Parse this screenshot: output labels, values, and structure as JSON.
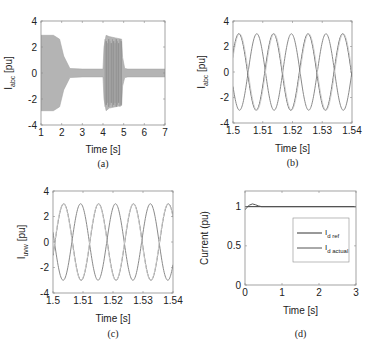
{
  "chart_data": [
    {
      "id": "a",
      "type": "line",
      "caption": "(a)",
      "title": "",
      "xlabel": "Time [s]",
      "ylabel": "I_abc [pu]",
      "ylabel_main": "I",
      "ylabel_sub": "abc",
      "ylabel_unit": "[pu]",
      "xlim": [
        1,
        7
      ],
      "ylim": [
        -4,
        4
      ],
      "xticks": [
        1,
        2,
        3,
        4,
        5,
        6,
        7
      ],
      "yticks": [
        -4,
        -2,
        0,
        2,
        4
      ],
      "grid": false,
      "description": "Three-phase current envelope (dense oscillation band)",
      "envelope": {
        "x": [
          1.0,
          1.6,
          1.9,
          2.1,
          2.4,
          3.0,
          4.0,
          4.05,
          4.15,
          4.3,
          4.6,
          4.9,
          4.95,
          5.05,
          5.2,
          7.0
        ],
        "upper": [
          2.9,
          2.9,
          2.6,
          1.3,
          0.35,
          0.3,
          0.3,
          2.0,
          2.9,
          2.8,
          2.7,
          2.6,
          1.2,
          0.35,
          0.3,
          0.3
        ],
        "lower": [
          -2.9,
          -2.9,
          -2.6,
          -1.3,
          -0.35,
          -0.3,
          -0.3,
          -2.0,
          -2.9,
          -2.7,
          -2.6,
          -2.5,
          -1.0,
          -0.35,
          -0.3,
          -0.3
        ]
      }
    },
    {
      "id": "b",
      "type": "line",
      "caption": "(b)",
      "title": "",
      "xlabel": "Time [s]",
      "ylabel": "I_abc [pu]",
      "ylabel_main": "I",
      "ylabel_sub": "abc",
      "ylabel_unit": "[pu]",
      "xlim": [
        1.5,
        1.54
      ],
      "ylim": [
        -4,
        4
      ],
      "xticks": [
        1.5,
        1.51,
        1.52,
        1.53,
        1.54
      ],
      "xtick_labels": [
        "1.5",
        "1.51",
        "1.52",
        "1.53",
        "1.54"
      ],
      "yticks": [
        -4,
        -2,
        0,
        2,
        4
      ],
      "grid": false,
      "series": [
        {
          "name": "phase a",
          "amplitude": 3.0,
          "frequency_hz": 86,
          "peak_time": 1.508,
          "color": "#8a8a8a"
        },
        {
          "name": "phase b",
          "amplitude": 3.0,
          "frequency_hz": 86,
          "peak_time": 1.5136,
          "color": "#6a6a6a"
        },
        {
          "name": "phase c",
          "amplitude": 3.0,
          "frequency_hz": 86,
          "peak_time": 1.5022,
          "color": "#cfcfcf"
        }
      ]
    },
    {
      "id": "c",
      "type": "line",
      "caption": "(c)",
      "title": "",
      "xlabel": "Time [s]",
      "ylabel": "I_uvw [pu]",
      "ylabel_main": "I",
      "ylabel_sub": "uvw",
      "ylabel_unit": "[pu]",
      "xlim": [
        1.5,
        1.54
      ],
      "ylim": [
        -4,
        4
      ],
      "xticks": [
        1.5,
        1.51,
        1.52,
        1.53,
        1.54
      ],
      "xtick_labels": [
        "1.5",
        "1.51",
        "1.52",
        "1.53",
        "1.54"
      ],
      "yticks": [
        -4,
        -2,
        0,
        2,
        4
      ],
      "grid": false,
      "series": [
        {
          "name": "phase u",
          "amplitude": 3.0,
          "frequency_hz": 86,
          "peak_time": 1.5092,
          "color": "#8a8a8a"
        },
        {
          "name": "phase v",
          "amplitude": 3.0,
          "frequency_hz": 86,
          "peak_time": 1.5152,
          "color": "#6a6a6a"
        },
        {
          "name": "phase w",
          "amplitude": 3.0,
          "frequency_hz": 86,
          "peak_time": 1.5035,
          "color": "#d2d2d2"
        }
      ]
    },
    {
      "id": "d",
      "type": "line",
      "caption": "(d)",
      "title": "",
      "xlabel": "Time [s]",
      "ylabel": "Current (pu)",
      "xlim": [
        0,
        3
      ],
      "ylim": [
        0,
        1.2
      ],
      "xticks": [
        0,
        1,
        2,
        3
      ],
      "yticks": [
        0,
        0.5,
        1
      ],
      "ytick_labels": [
        "0",
        "0.5",
        "1"
      ],
      "grid": false,
      "legend_position": "center-right",
      "series": [
        {
          "name": "I_d ref",
          "legend_main": "I",
          "legend_sub": "d ref",
          "x": [
            0,
            3
          ],
          "y": [
            1,
            1
          ],
          "color": "#333333"
        },
        {
          "name": "I_d actual",
          "legend_main": "I",
          "legend_sub": "d actual",
          "x": [
            0,
            0.05,
            0.12,
            0.2,
            0.28,
            0.36,
            0.45,
            0.6,
            3.0
          ],
          "y": [
            0.96,
            0.99,
            1.02,
            1.035,
            1.025,
            1.01,
            1.0,
            1.0,
            1.0
          ],
          "color": "#555555"
        }
      ]
    }
  ]
}
